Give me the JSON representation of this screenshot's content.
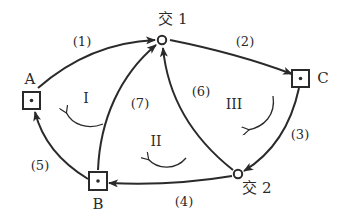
{
  "diagram": {
    "type": "directed-graph",
    "nodes": [
      {
        "id": "jiao1",
        "label": "交 1",
        "shape": "circle"
      },
      {
        "id": "jiao2",
        "label": "交 2",
        "shape": "circle"
      },
      {
        "id": "A",
        "label": "A",
        "shape": "square-dot"
      },
      {
        "id": "B",
        "label": "B",
        "shape": "square-dot"
      },
      {
        "id": "C",
        "label": "C",
        "shape": "square-dot"
      }
    ],
    "edges": [
      {
        "label": "(1)",
        "from": "A",
        "to": "jiao1"
      },
      {
        "label": "(2)",
        "from": "jiao1",
        "to": "C"
      },
      {
        "label": "(3)",
        "from": "C",
        "to": "jiao2"
      },
      {
        "label": "(4)",
        "from": "jiao2",
        "to": "B"
      },
      {
        "label": "(5)",
        "from": "B",
        "to": "A"
      },
      {
        "label": "(6)",
        "from": "jiao2",
        "to": "jiao1"
      },
      {
        "label": "(7)",
        "from": "B",
        "to": "jiao1"
      }
    ],
    "regions": [
      {
        "label": "I",
        "direction": "counterclockwise"
      },
      {
        "label": "II",
        "direction": "counterclockwise"
      },
      {
        "label": "III",
        "direction": "clockwise"
      }
    ]
  },
  "stroke_color": "#2a2a2a",
  "background_color": "#ffffff"
}
